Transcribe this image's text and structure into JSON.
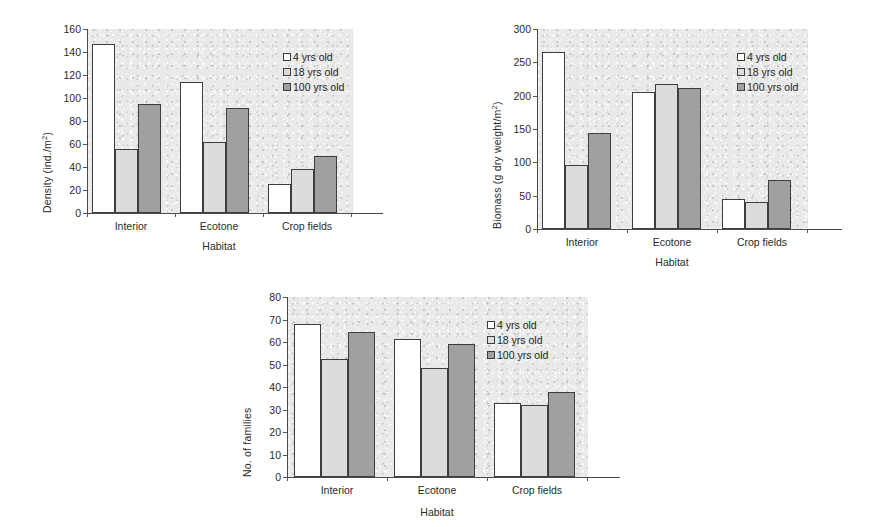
{
  "figure": {
    "series_names": [
      "4 yrs old",
      "18 yrs old",
      "100 yrs old"
    ],
    "series_colors": [
      "#ffffff",
      "#dcdcdc",
      "#a0a0a0"
    ],
    "categories": [
      "Interior",
      "Ecotone",
      "Crop fields"
    ],
    "xlabel": "Habitat"
  },
  "charts": [
    {
      "id": "density-chart",
      "ylabel_html": "Density (ind./m<sup>2</sup>)",
      "ylabel_text": "Density (ind./m2)",
      "xlabel": "Habitat",
      "categories": [
        "Interior",
        "Ecotone",
        "Crop fields"
      ],
      "yticks": [
        0,
        20,
        40,
        60,
        80,
        100,
        120,
        140,
        160
      ],
      "ylim": [
        0,
        160
      ],
      "legend": [
        "4 yrs old",
        "18 yrs old",
        "100 yrs old"
      ]
    },
    {
      "id": "biomass-chart",
      "ylabel_html": "Biomass (g dry weight/m<sup>2</sup>)",
      "ylabel_text": "Biomass (g dry weight/m2)",
      "xlabel": "Habitat",
      "categories": [
        "Interior",
        "Ecotone",
        "Crop fields"
      ],
      "yticks": [
        0,
        50,
        100,
        150,
        200,
        250,
        300
      ],
      "ylim": [
        0,
        300
      ],
      "legend": [
        "4 yrs old",
        "18 yrs old",
        "100 yrs old"
      ]
    },
    {
      "id": "families-chart",
      "ylabel_html": "No. of families",
      "ylabel_text": "No. of families",
      "xlabel": "Habitat",
      "categories": [
        "Interior",
        "Ecotone",
        "Crop fields"
      ],
      "yticks": [
        0,
        10,
        20,
        30,
        40,
        50,
        60,
        70,
        80
      ],
      "ylim": [
        0,
        80
      ],
      "legend": [
        "4 yrs old",
        "18 yrs old",
        "100 yrs old"
      ]
    }
  ],
  "chart_data": [
    {
      "type": "bar",
      "title": "",
      "xlabel": "Habitat",
      "ylabel": "Density (ind./m2)",
      "categories": [
        "Interior",
        "Ecotone",
        "Crop fields"
      ],
      "series": [
        {
          "name": "4 yrs old",
          "values": [
            147,
            114,
            25
          ]
        },
        {
          "name": "18 yrs old",
          "values": [
            56,
            62,
            38
          ]
        },
        {
          "name": "100 yrs old",
          "values": [
            95,
            91,
            50
          ]
        }
      ],
      "ylim": [
        0,
        160
      ],
      "yticks": [
        0,
        20,
        40,
        60,
        80,
        100,
        120,
        140,
        160
      ],
      "grid": false,
      "legend_position": "top-right"
    },
    {
      "type": "bar",
      "title": "",
      "xlabel": "Habitat",
      "ylabel": "Biomass (g dry weight/m2)",
      "categories": [
        "Interior",
        "Ecotone",
        "Crop fields"
      ],
      "series": [
        {
          "name": "4 yrs old",
          "values": [
            265,
            205,
            45
          ]
        },
        {
          "name": "18 yrs old",
          "values": [
            96,
            218,
            40
          ]
        },
        {
          "name": "100 yrs old",
          "values": [
            144,
            211,
            74
          ]
        }
      ],
      "ylim": [
        0,
        300
      ],
      "yticks": [
        0,
        50,
        100,
        150,
        200,
        250,
        300
      ],
      "grid": false,
      "legend_position": "top-right"
    },
    {
      "type": "bar",
      "title": "",
      "xlabel": "Habitat",
      "ylabel": "No. of families",
      "categories": [
        "Interior",
        "Ecotone",
        "Crop fields"
      ],
      "series": [
        {
          "name": "4 yrs old",
          "values": [
            68,
            61.5,
            33
          ]
        },
        {
          "name": "18 yrs old",
          "values": [
            52.5,
            48.5,
            32
          ]
        },
        {
          "name": "100 yrs old",
          "values": [
            64.5,
            59,
            38
          ]
        }
      ],
      "ylim": [
        0,
        80
      ],
      "yticks": [
        0,
        10,
        20,
        30,
        40,
        50,
        60,
        70,
        80
      ],
      "grid": false,
      "legend_position": "top-right"
    }
  ]
}
